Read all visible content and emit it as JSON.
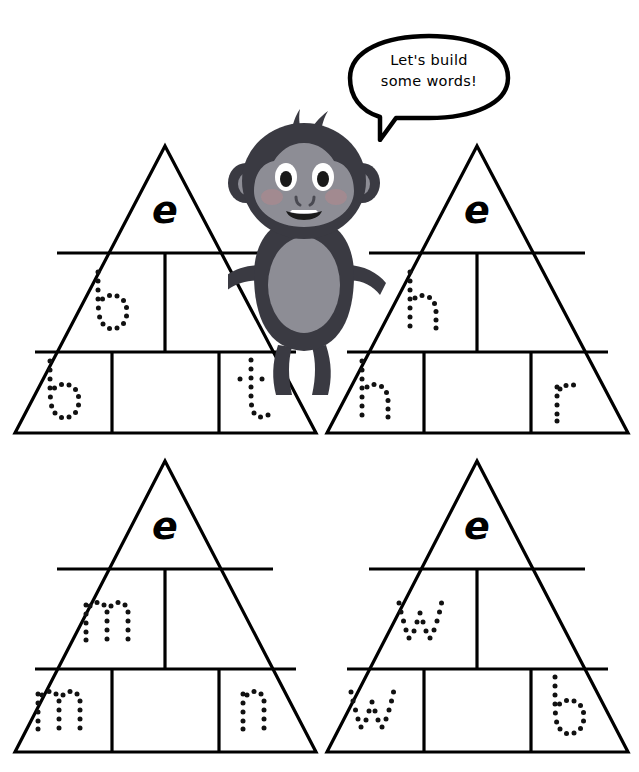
{
  "page": {
    "background_color": "#ffffff",
    "ghost_header": "",
    "ink_color": "#000000"
  },
  "character": {
    "name": "monkey",
    "body_color": "#3a3a42",
    "face_color": "#8d8d95",
    "belly_color": "#8d8d95",
    "cheek_color": "#a9898f",
    "eye_white": "#ffffff",
    "pupil_color": "#1a1a1a",
    "hand_color": "#b9b9bf"
  },
  "speech_bubble": {
    "line1": "Let's build",
    "line2": "some words!",
    "text": "Let's build\nsome words!",
    "outline_color": "#000000",
    "fill_color": "#ffffff"
  },
  "pyramids": [
    {
      "id": "pyramid-1",
      "word": "bet",
      "apex_letter": "e",
      "apex_style": "solid",
      "rows": [
        {
          "row": 1,
          "cells": [
            {
              "letter": "e",
              "style": "solid"
            }
          ]
        },
        {
          "row": 2,
          "cells": [
            {
              "letter": "b",
              "style": "dotted"
            },
            {
              "letter": "",
              "style": "blank"
            }
          ]
        },
        {
          "row": 3,
          "cells": [
            {
              "letter": "b",
              "style": "dotted"
            },
            {
              "letter": "",
              "style": "blank"
            },
            {
              "letter": "t",
              "style": "dotted"
            }
          ]
        }
      ]
    },
    {
      "id": "pyramid-2",
      "word": "her",
      "apex_letter": "e",
      "apex_style": "solid",
      "rows": [
        {
          "row": 1,
          "cells": [
            {
              "letter": "e",
              "style": "solid"
            }
          ]
        },
        {
          "row": 2,
          "cells": [
            {
              "letter": "h",
              "style": "dotted"
            },
            {
              "letter": "",
              "style": "blank"
            }
          ]
        },
        {
          "row": 3,
          "cells": [
            {
              "letter": "h",
              "style": "dotted"
            },
            {
              "letter": "",
              "style": "blank"
            },
            {
              "letter": "r",
              "style": "dotted"
            }
          ]
        }
      ]
    },
    {
      "id": "pyramid-3",
      "word": "men",
      "apex_letter": "e",
      "apex_style": "solid",
      "rows": [
        {
          "row": 1,
          "cells": [
            {
              "letter": "e",
              "style": "solid"
            }
          ]
        },
        {
          "row": 2,
          "cells": [
            {
              "letter": "m",
              "style": "dotted"
            },
            {
              "letter": "",
              "style": "blank"
            }
          ]
        },
        {
          "row": 3,
          "cells": [
            {
              "letter": "m",
              "style": "dotted"
            },
            {
              "letter": "",
              "style": "blank"
            },
            {
              "letter": "n",
              "style": "dotted"
            }
          ]
        }
      ]
    },
    {
      "id": "pyramid-4",
      "word": "web",
      "apex_letter": "e",
      "apex_style": "solid",
      "rows": [
        {
          "row": 1,
          "cells": [
            {
              "letter": "e",
              "style": "solid"
            }
          ]
        },
        {
          "row": 2,
          "cells": [
            {
              "letter": "w",
              "style": "dotted"
            },
            {
              "letter": "",
              "style": "blank"
            }
          ]
        },
        {
          "row": 3,
          "cells": [
            {
              "letter": "w",
              "style": "dotted"
            },
            {
              "letter": "",
              "style": "blank"
            },
            {
              "letter": "b",
              "style": "dotted"
            }
          ]
        }
      ]
    }
  ],
  "letters": {
    "p1_apex": "e",
    "p1_r2c1": "b",
    "p1_r3c1": "b",
    "p1_r3c3": "t",
    "p2_apex": "e",
    "p2_r2c1": "h",
    "p2_r3c1": "h",
    "p2_r3c3": "r",
    "p3_apex": "e",
    "p3_r2c1": "m",
    "p3_r3c1": "m",
    "p3_r3c3": "n",
    "p4_apex": "e",
    "p4_r2c1": "w",
    "p4_r3c1": "w",
    "p4_r3c3": "b"
  }
}
